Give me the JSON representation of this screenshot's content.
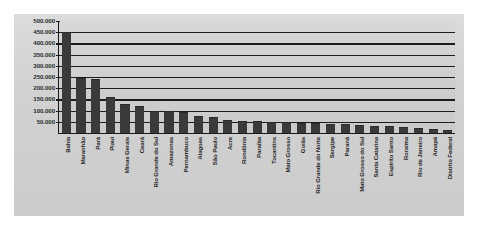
{
  "chart_data": {
    "type": "bar",
    "title": "",
    "subtitle": "",
    "xlabel": "",
    "ylabel": "",
    "ylim": [
      0,
      500000
    ],
    "ytick_labels": [
      "500.000",
      "450.000",
      "400.000",
      "350.000",
      "300.000",
      "250.000",
      "200.000",
      "150.000",
      "100.000",
      "50.000"
    ],
    "ytick_values": [
      500000,
      450000,
      400000,
      350000,
      300000,
      250000,
      200000,
      150000,
      100000,
      50000
    ],
    "grid": true,
    "grid_axis": "y",
    "legend": false,
    "legend_position": "none",
    "bar_color": "#3a3a3a",
    "plot_background": "#d2d2d2",
    "axis_color": "#1a1a1a",
    "categories": [
      "Bahia",
      "Maranhão",
      "Pará",
      "Piauí",
      "Minas Gerais",
      "Ceará",
      "Rio Grande do Sul",
      "Amazonas",
      "Pernambuco",
      "Alagoas",
      "São Paulo",
      "Acre",
      "Rondônia",
      "Paraíba",
      "Tocantins",
      "Mato Grosso",
      "Goiás",
      "Rio Grande do Norte",
      "Sergipe",
      "Paraná",
      "Mato Grosso do Sul",
      "Santa Catarina",
      "Espírito Santo",
      "Roraima",
      "Rio de Janeiro",
      "Amapá",
      "Distrito Federal"
    ],
    "values": [
      448000,
      243000,
      236000,
      155000,
      124000,
      118000,
      95000,
      92000,
      88000,
      72000,
      68000,
      52000,
      50000,
      48000,
      46000,
      44000,
      42000,
      40000,
      37000,
      34000,
      31000,
      28000,
      25000,
      22000,
      18000,
      12000,
      7000
    ]
  }
}
